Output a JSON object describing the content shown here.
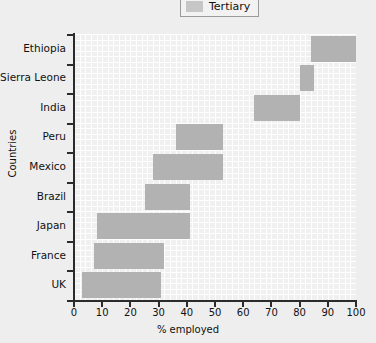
{
  "legend": {
    "position": "top-center",
    "entries": [
      {
        "label": "Tertiary",
        "color": "#c6c6c6",
        "icon": "color-swatch"
      }
    ]
  },
  "chart_data": {
    "type": "bar",
    "orientation": "horizontal",
    "title": "",
    "subtitle": "",
    "xlabel": "% employed",
    "ylabel": "Countries",
    "xlim": [
      0,
      100
    ],
    "xticks": [
      "0",
      "10",
      "20",
      "30",
      "40",
      "50",
      "60",
      "70",
      "80",
      "90",
      "100"
    ],
    "grid": true,
    "legend_position": "top-center",
    "series": [
      {
        "name": "Tertiary",
        "color": "#b2b2b2",
        "bars": [
          {
            "category": "Ethiopia",
            "start": 84,
            "end": 100,
            "value": 16
          },
          {
            "category": "Sierra Leone",
            "start": 80,
            "end": 85,
            "value": 5
          },
          {
            "category": "India",
            "start": 64,
            "end": 80,
            "value": 16
          },
          {
            "category": "Peru",
            "start": 36,
            "end": 53,
            "value": 17
          },
          {
            "category": "Mexico",
            "start": 28,
            "end": 53,
            "value": 25
          },
          {
            "category": "Brazil",
            "start": 25,
            "end": 41,
            "value": 16
          },
          {
            "category": "Japan",
            "start": 8,
            "end": 41,
            "value": 33
          },
          {
            "category": "France",
            "start": 7,
            "end": 32,
            "value": 25
          },
          {
            "category": "UK",
            "start": 3,
            "end": 31,
            "value": 28
          }
        ]
      }
    ],
    "categories": [
      "Ethiopia",
      "Sierra Leone",
      "India",
      "Peru",
      "Mexico",
      "Brazil",
      "Japan",
      "France",
      "UK"
    ],
    "values": [
      16,
      5,
      16,
      17,
      25,
      16,
      33,
      25,
      28
    ]
  },
  "colors": {
    "background": "#eeeeee",
    "plot_background": "#f0f0f0",
    "bar": "#b2b2b2",
    "axis": "#2b2b2b",
    "grid": "#ffffff"
  }
}
